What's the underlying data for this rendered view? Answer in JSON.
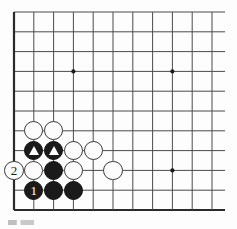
{
  "figure": {
    "kind": "go-board-diagram",
    "background_color": "#fdfdfd"
  },
  "board": {
    "columns": 11,
    "rows": 11,
    "origin_x": 14,
    "origin_y": 12,
    "spacing": 19.8,
    "line_color": "#4a4a4a",
    "edge_color": "#2a2a2a",
    "line_width": 1.0,
    "edge_width": 2.2,
    "stone_radius": 9.6,
    "star_point_radius": 2.1,
    "star_point_color": "#1a1a1a",
    "star_points": [
      {
        "col": 4,
        "row": 4
      },
      {
        "col": 9,
        "row": 4
      },
      {
        "col": 9,
        "row": 9
      }
    ]
  },
  "stones": [
    {
      "col": 2,
      "row": 7,
      "color": "white",
      "marker": "none",
      "label": ""
    },
    {
      "col": 3,
      "row": 7,
      "color": "white",
      "marker": "none",
      "label": ""
    },
    {
      "col": 2,
      "row": 8,
      "color": "black",
      "marker": "triangle",
      "label": ""
    },
    {
      "col": 3,
      "row": 8,
      "color": "black",
      "marker": "triangle",
      "label": ""
    },
    {
      "col": 4,
      "row": 8,
      "color": "white",
      "marker": "none",
      "label": ""
    },
    {
      "col": 5,
      "row": 8,
      "color": "white",
      "marker": "none",
      "label": ""
    },
    {
      "col": 1,
      "row": 9,
      "color": "white",
      "marker": "number",
      "label": "2"
    },
    {
      "col": 2,
      "row": 9,
      "color": "white",
      "marker": "none",
      "label": ""
    },
    {
      "col": 3,
      "row": 9,
      "color": "black",
      "marker": "none",
      "label": ""
    },
    {
      "col": 4,
      "row": 9,
      "color": "white",
      "marker": "none",
      "label": ""
    },
    {
      "col": 6,
      "row": 9,
      "color": "white",
      "marker": "none",
      "label": ""
    },
    {
      "col": 2,
      "row": 10,
      "color": "black",
      "marker": "number",
      "label": "1"
    },
    {
      "col": 3,
      "row": 10,
      "color": "black",
      "marker": "none",
      "label": ""
    },
    {
      "col": 4,
      "row": 10,
      "color": "black",
      "marker": "none",
      "label": ""
    }
  ],
  "move_labels": {
    "black_move": "1",
    "white_move": "2"
  },
  "colors": {
    "black_stone": "#1a1a1a",
    "white_stone": "#fcfcfc",
    "white_stone_border": "#3a3a3a",
    "grid": "#4a4a4a",
    "marker_on_black": "#ffffff"
  }
}
